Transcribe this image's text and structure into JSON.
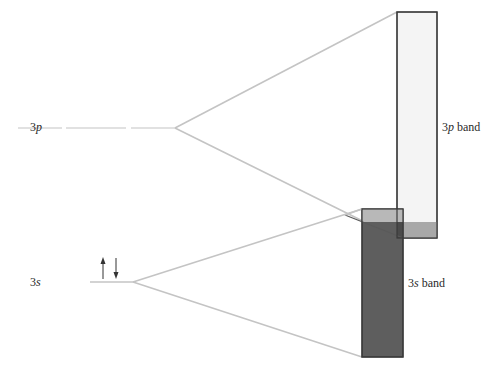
{
  "diagram": {
    "levels": [
      {
        "id": "3p",
        "orbital": "3",
        "sublevel": "p",
        "electrons": 0
      },
      {
        "id": "3s",
        "orbital": "3",
        "sublevel": "s",
        "electrons": 2
      }
    ],
    "bands": [
      {
        "id": "3p-band",
        "prefix": "3",
        "sublevel": "p",
        "suffix": " band",
        "fill": "#f4f4f4"
      },
      {
        "id": "3s-band",
        "prefix": "3",
        "sublevel": "s",
        "suffix": " band",
        "fill": "#5e5e5e"
      }
    ],
    "colors": {
      "fan_lines": "#c4c4c4",
      "rect_stroke": "#3a3a3a",
      "overlap_light": "#c8c8c8",
      "overlap_dark": "#4a4a4a",
      "arrows": "#333333"
    }
  }
}
